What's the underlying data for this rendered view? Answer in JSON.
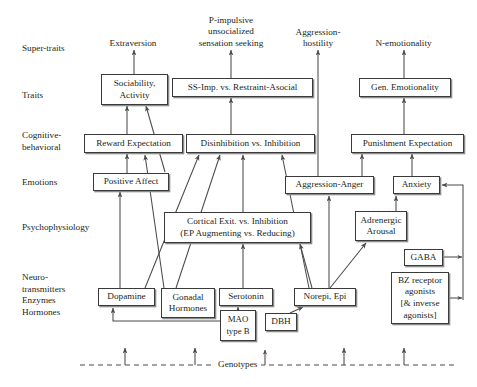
{
  "diagram": {
    "background_color": "#ffffff",
    "line_color": "#4a4a4a",
    "text_color": "#231f20",
    "box_border_color": "#3a3a3a",
    "box_shadow_color": "#8c8c8c"
  },
  "row_labels": [
    {
      "id": "super-traits",
      "text": "Super-traits",
      "x": 22,
      "y": 43
    },
    {
      "id": "traits",
      "text": "Traits",
      "x": 22,
      "y": 90
    },
    {
      "id": "cognitive-behavioral",
      "text": "Cognitive-\nbehavioral",
      "x": 22,
      "y": 130
    },
    {
      "id": "emotions",
      "text": "Emotions",
      "x": 22,
      "y": 177
    },
    {
      "id": "psychophysiology",
      "text": "Psychophysiology",
      "x": 22,
      "y": 222
    },
    {
      "id": "neurotransmitters",
      "text": "Neuro-\ntransmitters\nEnzymes\nHormones",
      "x": 22,
      "y": 272
    }
  ],
  "super_traits": [
    {
      "id": "extraversion",
      "text": "Extraversion",
      "cx": 133,
      "y": 38
    },
    {
      "id": "p-impulsive",
      "text": "P-impulsive\nunsocialized\nsensation seeking",
      "cx": 231,
      "y": 15
    },
    {
      "id": "aggression-hostility",
      "text": "Aggression-\nhostility",
      "cx": 318,
      "y": 27
    },
    {
      "id": "n-emotionality",
      "text": "N-emotionality",
      "cx": 403,
      "y": 38
    }
  ],
  "nodes": [
    {
      "id": "sociability-activity",
      "text": "Sociability,\nActivity",
      "x": 101,
      "y": 74,
      "w": 67,
      "h": 31
    },
    {
      "id": "ss-imp-restraint",
      "text": "SS-Imp. vs. Restraint-Asocial",
      "x": 172,
      "y": 78,
      "w": 141,
      "h": 19
    },
    {
      "id": "gen-emotionality",
      "text": "Gen. Emotionality",
      "x": 359,
      "y": 78,
      "w": 92,
      "h": 19
    },
    {
      "id": "reward-expectation",
      "text": "Reward Expectation",
      "x": 84,
      "y": 134,
      "w": 99,
      "h": 19
    },
    {
      "id": "disinhibition-inhibition",
      "text": "Disinhibition vs. Inhibition",
      "x": 186,
      "y": 134,
      "w": 129,
      "h": 19
    },
    {
      "id": "punishment-expectation",
      "text": "Punishment Expectation",
      "x": 351,
      "y": 134,
      "w": 113,
      "h": 19
    },
    {
      "id": "positive-affect",
      "text": "Positive Affect",
      "x": 93,
      "y": 173,
      "w": 76,
      "h": 18
    },
    {
      "id": "aggression-anger",
      "text": "Aggression-Anger",
      "x": 285,
      "y": 176,
      "w": 89,
      "h": 18
    },
    {
      "id": "anxiety",
      "text": "Anxiety",
      "x": 393,
      "y": 176,
      "w": 47,
      "h": 18
    },
    {
      "id": "cortical-exit",
      "text": "Cortical Exit. vs. Inhibition\n(EP Augmenting vs. Reducing)",
      "x": 164,
      "y": 212,
      "w": 147,
      "h": 31
    },
    {
      "id": "adrenergic-arousal",
      "text": "Adrenergic\nArousal",
      "x": 355,
      "y": 211,
      "w": 52,
      "h": 30
    },
    {
      "id": "dopamine",
      "text": "Dopamine",
      "x": 98,
      "y": 288,
      "w": 57,
      "h": 18
    },
    {
      "id": "gonadal-hormones",
      "text": "Gonadal\nHormones",
      "x": 161,
      "y": 288,
      "w": 54,
      "h": 30
    },
    {
      "id": "serotonin",
      "text": "Serotonin",
      "x": 219,
      "y": 288,
      "w": 54,
      "h": 18
    },
    {
      "id": "mao-type-b",
      "text": "MAO\ntype B",
      "x": 220,
      "y": 310,
      "w": 36,
      "h": 31
    },
    {
      "id": "norepi-epi",
      "text": "Norepi, Epi",
      "x": 294,
      "y": 288,
      "w": 62,
      "h": 18
    },
    {
      "id": "dbh",
      "text": "DBH",
      "x": 265,
      "y": 313,
      "w": 32,
      "h": 18
    },
    {
      "id": "gaba",
      "text": "GABA",
      "x": 404,
      "y": 249,
      "w": 39,
      "h": 17
    },
    {
      "id": "bz-receptor",
      "text": "BZ receptor\nagonists\n[& inverse\nagonists]",
      "x": 391,
      "y": 272,
      "w": 58,
      "h": 52
    }
  ],
  "genotypes": {
    "label": "Genotypes",
    "label_x": 214,
    "dashed_line_y": 365,
    "dashed_line_x1": 80,
    "dashed_line_x2": 456,
    "arrow_x_positions": [
      125,
      195,
      265,
      344,
      404
    ],
    "arrow_top_y": 348
  },
  "edge_descriptions": [
    "Sociability, Activity -> Extraversion",
    "SS-Imp. vs. Restraint-Asocial -> P-impulsive unsocialized sensation seeking",
    "Aggression-Anger -> Aggression-hostility",
    "Gen. Emotionality -> N-emotionality",
    "Reward Expectation <-> Sociability, Activity",
    "Positive Affect -> Sociability, Activity",
    "Positive Affect <-> Reward Expectation",
    "Disinhibition vs. Inhibition -> SS-Imp. vs. Restraint-Asocial",
    "Punishment Expectation <-> Gen. Emotionality",
    "Anxiety <-> Punishment Expectation",
    "Aggression-Anger <-> Punishment Expectation",
    "Cortical Exit. vs. Inhibition -> Disinhibition vs. Inhibition",
    "Dopamine -> Positive Affect",
    "Dopamine -> Disinhibition vs. Inhibition",
    "Gonadal Hormones -> Disinhibition vs. Inhibition",
    "Gonadal Hormones -> Reward Expectation",
    "Serotonin -> Cortical Exit. vs. Inhibition",
    "MAO type B -> Serotonin",
    "MAO type B -> Dopamine",
    "DBH -> Norepi, Epi",
    "Norepi, Epi -> Adrenergic Arousal",
    "Norepi, Epi -> Disinhibition vs. Inhibition",
    "Norepi, Epi -> Aggression-Anger",
    "Adrenergic Arousal <-> Anxiety",
    "GABA -> Anxiety",
    "BZ receptor agonists -> Anxiety",
    "Genotypes -> Dopamine / Gonadal Hormones / MAO type B / Norepi, Epi / BZ receptor agonists"
  ]
}
